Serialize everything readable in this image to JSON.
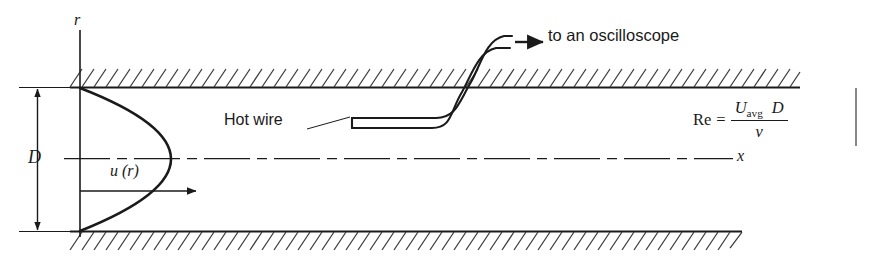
{
  "figure": {
    "labels": {
      "oscilloscope": "to an oscilloscope",
      "hot_wire": "Hot wire",
      "radial_axis": "r",
      "axial_axis": "x",
      "diameter": "D",
      "velocity_profile": "u (r)"
    },
    "formula": {
      "lhs": "Re",
      "equals": "=",
      "numerator_symbol": "U",
      "numerator_subscript": "avg",
      "numerator_second": "D",
      "denominator": "ν"
    },
    "colors": {
      "line": "#1a1a1a",
      "hatch": "#3a3a3a",
      "background": "#ffffff"
    }
  }
}
